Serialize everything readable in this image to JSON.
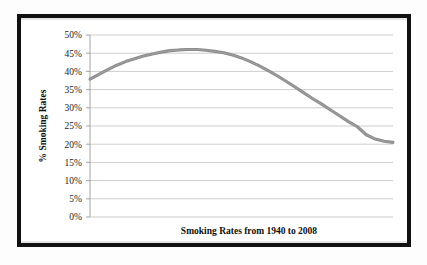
{
  "chart_data": {
    "type": "line",
    "title": "",
    "xlabel": "Smoking Rates from 1940 to 2008",
    "ylabel": "% Smoking Rates",
    "ylim": [
      0,
      50
    ],
    "ytick_labels": [
      "50%",
      "45%",
      "40%",
      "35%",
      "30%",
      "25%",
      "20%",
      "15%",
      "10%",
      "5%",
      "0%"
    ],
    "ytick_values": [
      50,
      45,
      40,
      35,
      30,
      25,
      20,
      15,
      10,
      5,
      0
    ],
    "xlim": [
      1940,
      2008
    ],
    "xtick_labels": [],
    "grid": "horizontal",
    "legend": "none",
    "series": [
      {
        "name": "% Smoking Rates",
        "color": "#8d8d8d",
        "x": [
          1940,
          1942,
          1944,
          1946,
          1948,
          1950,
          1952,
          1954,
          1956,
          1958,
          1960,
          1962,
          1964,
          1966,
          1968,
          1970,
          1972,
          1974,
          1976,
          1978,
          1980,
          1982,
          1984,
          1986,
          1988,
          1990,
          1992,
          1994,
          1996,
          1998,
          2000,
          2002,
          2004,
          2006,
          2008
        ],
        "values": [
          37.9,
          39.2,
          40.5,
          41.7,
          42.7,
          43.5,
          44.2,
          44.8,
          45.3,
          45.7,
          45.9,
          46.0,
          46.0,
          45.8,
          45.5,
          45.1,
          44.5,
          43.7,
          42.7,
          41.5,
          40.2,
          38.8,
          37.3,
          35.7,
          34.1,
          32.5,
          31.0,
          29.4,
          27.8,
          26.2,
          24.8,
          22.6,
          21.4,
          20.8,
          20.5
        ]
      }
    ]
  },
  "figure": {
    "frame_color": "#111111",
    "background_color": "#ffffff"
  }
}
